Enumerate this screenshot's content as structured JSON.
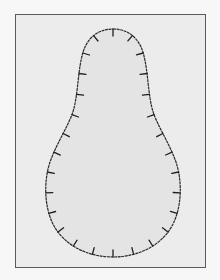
{
  "diagram": {
    "type": "closed-outline-with-inward-ticks",
    "shape": "pear / teardrop (narrow top, wide rounded bottom)",
    "colors": {
      "page_background": "#f7f7f7",
      "frame_fill": "#ececec",
      "frame_border": "#5a5a5a",
      "shape_fill": "#e4e4e4",
      "outline": "#2a2a2a",
      "ticks": "#1e1e1e"
    },
    "tick_count": 28,
    "labels": []
  }
}
